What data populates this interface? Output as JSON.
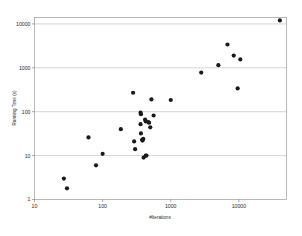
{
  "chart_data": {
    "type": "scatter",
    "title": "",
    "xlabel": "#Iterations",
    "ylabel": "Running Time (s)",
    "xscale": "log",
    "yscale": "log",
    "xlim": [
      10,
      50000
    ],
    "ylim": [
      1,
      14000
    ],
    "xticks": [
      10,
      100,
      1000,
      10000
    ],
    "xtick_labels": [
      "10",
      "100",
      "1000",
      "10000"
    ],
    "yticks": [
      1,
      10,
      100,
      1000,
      10000
    ],
    "ytick_labels": [
      "1",
      "10",
      "100",
      "1000",
      "10000"
    ],
    "grid": "horizontal",
    "legend": "none",
    "marker": "filled-circle",
    "marker_color": "#1a1a1a",
    "series": [
      {
        "name": "runs",
        "points": [
          [
            27,
            3.0
          ],
          [
            30,
            1.8
          ],
          [
            62,
            26
          ],
          [
            80,
            6.0
          ],
          [
            100,
            11
          ],
          [
            185,
            40
          ],
          [
            280,
            270
          ],
          [
            290,
            21
          ],
          [
            300,
            14
          ],
          [
            360,
            95
          ],
          [
            365,
            88
          ],
          [
            360,
            52
          ],
          [
            365,
            32
          ],
          [
            380,
            23
          ],
          [
            385,
            22
          ],
          [
            395,
            24
          ],
          [
            400,
            9.0
          ],
          [
            420,
            66
          ],
          [
            430,
            60
          ],
          [
            430,
            10
          ],
          [
            440,
            10
          ],
          [
            470,
            58
          ],
          [
            480,
            56
          ],
          [
            500,
            44
          ],
          [
            520,
            190
          ],
          [
            560,
            82
          ],
          [
            1000,
            185
          ],
          [
            2800,
            780
          ],
          [
            5000,
            1150
          ],
          [
            6800,
            3400
          ],
          [
            8400,
            1900
          ],
          [
            9600,
            340
          ],
          [
            10500,
            1550
          ],
          [
            40000,
            12000
          ]
        ]
      }
    ]
  },
  "axes": {
    "x_title": "#Iterations",
    "y_title": "Running Time (s)"
  }
}
